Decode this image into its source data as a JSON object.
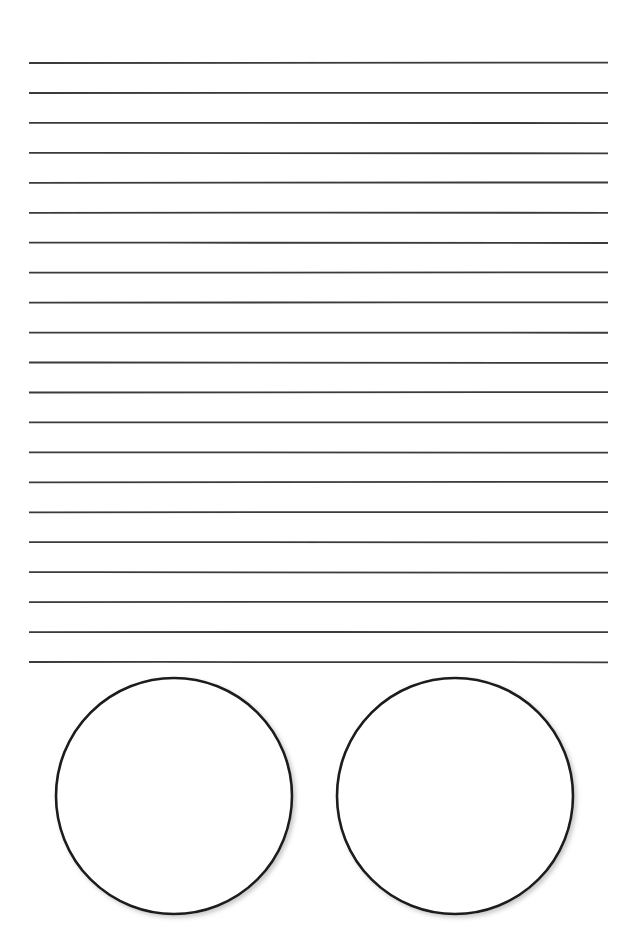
{
  "page": {
    "name": "lined-worksheet-page",
    "width": 639,
    "height": 942,
    "background_color": "#ffffff",
    "text_content": ""
  },
  "writing_area": {
    "name": "ruled-writing-area",
    "line_count": 21,
    "line_color": "#3a3a3a",
    "line_thickness": 1.8,
    "line_x_start": 29,
    "line_x_end": 608,
    "line_length": 579,
    "first_line_y": 63,
    "line_spacing": 29.95,
    "lines": [
      {
        "index": 1,
        "y": 63.0,
        "label": "ruled-line-1",
        "content": ""
      },
      {
        "index": 2,
        "y": 93.0,
        "label": "ruled-line-2",
        "content": ""
      },
      {
        "index": 3,
        "y": 122.9,
        "label": "ruled-line-3",
        "content": ""
      },
      {
        "index": 4,
        "y": 152.9,
        "label": "ruled-line-4",
        "content": ""
      },
      {
        "index": 5,
        "y": 182.8,
        "label": "ruled-line-5",
        "content": ""
      },
      {
        "index": 6,
        "y": 212.8,
        "label": "ruled-line-6",
        "content": ""
      },
      {
        "index": 7,
        "y": 242.7,
        "label": "ruled-line-7",
        "content": ""
      },
      {
        "index": 8,
        "y": 272.7,
        "label": "ruled-line-8",
        "content": ""
      },
      {
        "index": 9,
        "y": 302.6,
        "label": "ruled-line-9",
        "content": ""
      },
      {
        "index": 10,
        "y": 332.6,
        "label": "ruled-line-10",
        "content": ""
      },
      {
        "index": 11,
        "y": 362.5,
        "label": "ruled-line-11",
        "content": ""
      },
      {
        "index": 12,
        "y": 392.5,
        "label": "ruled-line-12",
        "content": ""
      },
      {
        "index": 13,
        "y": 422.4,
        "label": "ruled-line-13",
        "content": ""
      },
      {
        "index": 14,
        "y": 452.4,
        "label": "ruled-line-14",
        "content": ""
      },
      {
        "index": 15,
        "y": 482.3,
        "label": "ruled-line-15",
        "content": ""
      },
      {
        "index": 16,
        "y": 512.3,
        "label": "ruled-line-16",
        "content": ""
      },
      {
        "index": 17,
        "y": 542.2,
        "label": "ruled-line-17",
        "content": ""
      },
      {
        "index": 18,
        "y": 572.2,
        "label": "ruled-line-18",
        "content": ""
      },
      {
        "index": 19,
        "y": 602.1,
        "label": "ruled-line-19",
        "content": ""
      },
      {
        "index": 20,
        "y": 632.1,
        "label": "ruled-line-20",
        "content": ""
      },
      {
        "index": 21,
        "y": 662.0,
        "label": "ruled-line-21",
        "content": ""
      }
    ]
  },
  "answer_area": {
    "name": "answer-circles-area",
    "circle_count": 2,
    "stroke_color": "#1a1a1a",
    "fill_color": "#ffffff",
    "stroke_width": 2.6,
    "circles": [
      {
        "index": 1,
        "label": "answer-circle-left",
        "cx": 174,
        "cy": 796,
        "r": 118,
        "content": ""
      },
      {
        "index": 2,
        "label": "answer-circle-right",
        "cx": 455,
        "cy": 796,
        "r": 118,
        "content": ""
      }
    ]
  }
}
